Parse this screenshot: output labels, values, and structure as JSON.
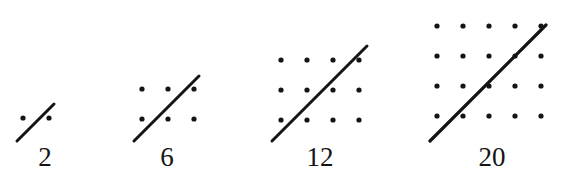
{
  "page": {
    "background_color": "#ffffff",
    "ink_color": "#141414",
    "width": 564,
    "height": 172
  },
  "chart_data": {
    "type": "diagram",
    "title": "",
    "xlabel": "",
    "ylabel": "",
    "categories": [
      "2",
      "6",
      "12",
      "20"
    ],
    "values": [
      2,
      6,
      12,
      20
    ],
    "figures": [
      {
        "label": "2",
        "rows": 1,
        "cols": 2,
        "dot_count": 2,
        "origin_x": 23,
        "origin_y": 118,
        "spacing_x": 26,
        "spacing_y": 30,
        "dot_radius": 2.6,
        "line": {
          "x1": 17,
          "y1": 141,
          "x2": 54,
          "y2": 104,
          "width": 3
        },
        "label_x": 45,
        "label_y": 166
      },
      {
        "label": "6",
        "rows": 2,
        "cols": 3,
        "dot_count": 6,
        "origin_x": 142,
        "origin_y": 89,
        "spacing_x": 26,
        "spacing_y": 30,
        "dot_radius": 2.6,
        "line": {
          "x1": 134,
          "y1": 141,
          "x2": 199,
          "y2": 76,
          "width": 3
        },
        "label_x": 167,
        "label_y": 166
      },
      {
        "label": "12",
        "rows": 3,
        "cols": 4,
        "dot_count": 12,
        "origin_x": 281,
        "origin_y": 60,
        "spacing_x": 26,
        "spacing_y": 30,
        "dot_radius": 2.6,
        "line": {
          "x1": 272,
          "y1": 141,
          "x2": 367,
          "y2": 46,
          "width": 3
        },
        "label_x": 320,
        "label_y": 166
      },
      {
        "label": "20",
        "rows": 4,
        "cols": 5,
        "dot_count": 20,
        "origin_x": 437,
        "origin_y": 26,
        "spacing_x": 26,
        "spacing_y": 30,
        "dot_radius": 2.6,
        "line": {
          "x1": 430,
          "y1": 141,
          "x2": 546,
          "y2": 25,
          "width": 3.2
        },
        "label_x": 492,
        "label_y": 166
      }
    ]
  }
}
